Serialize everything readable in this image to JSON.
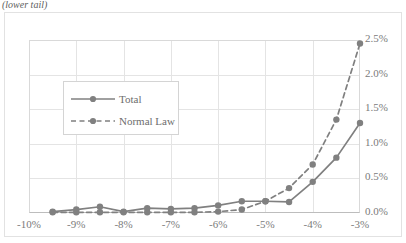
{
  "caption": "(lower tail)",
  "legend": {
    "entries": [
      {
        "label": "Total",
        "style": "solid",
        "color": "#808080"
      },
      {
        "label": "Normal Law",
        "style": "dashed",
        "color": "#808080"
      }
    ]
  },
  "axes": {
    "x_ticks": [
      "-10%",
      "-9%",
      "-8%",
      "-7%",
      "-6%",
      "-5%",
      "-4%",
      "-3%"
    ],
    "y_ticks": [
      "0.0%",
      "0.5%",
      "1.0%",
      "1.5%",
      "2.0%",
      "2.5%"
    ],
    "y_axis_position": "right"
  },
  "colors": {
    "series": "#808080",
    "grid": "#e4e4e4",
    "plot_border": "#d9d9d9",
    "frame": "#e2e2e2",
    "text": "#7b7b7b"
  },
  "chart_data": {
    "type": "line",
    "title": "",
    "subtitle": "(lower tail)",
    "xlabel": "",
    "ylabel": "",
    "xlim": [
      -10,
      -3
    ],
    "ylim": [
      0,
      2.5
    ],
    "x_tick_values": [
      -10,
      -9,
      -8,
      -7,
      -6,
      -5,
      -4,
      -3
    ],
    "x_tick_labels": [
      "-10%",
      "-9%",
      "-8%",
      "-7%",
      "-6%",
      "-5%",
      "-4%",
      "-3%"
    ],
    "y_tick_values": [
      0,
      0.5,
      1.0,
      1.5,
      2.0,
      2.5
    ],
    "y_tick_labels": [
      "0.0%",
      "0.5%",
      "1.0%",
      "1.5%",
      "2.0%",
      "2.5%"
    ],
    "y_axis_position": "right",
    "grid": true,
    "legend_position": "inside-upper-left",
    "marker": "circle",
    "x": [
      -9.5,
      -9.0,
      -8.5,
      -8.0,
      -7.5,
      -7.0,
      -6.5,
      -6.0,
      -5.5,
      -5.0,
      -4.5,
      -4.0,
      -3.5,
      -3.0
    ],
    "series": [
      {
        "name": "Total",
        "style": "solid",
        "color": "#808080",
        "values": [
          0.02,
          0.05,
          0.09,
          0.02,
          0.07,
          0.06,
          0.07,
          0.11,
          0.17,
          0.17,
          0.16,
          0.45,
          0.8,
          1.3
        ]
      },
      {
        "name": "Normal Law",
        "style": "dashed",
        "color": "#808080",
        "values": [
          0.01,
          0.01,
          0.01,
          0.01,
          0.01,
          0.01,
          0.01,
          0.02,
          0.05,
          0.17,
          0.36,
          0.7,
          1.35,
          2.45
        ]
      }
    ]
  }
}
